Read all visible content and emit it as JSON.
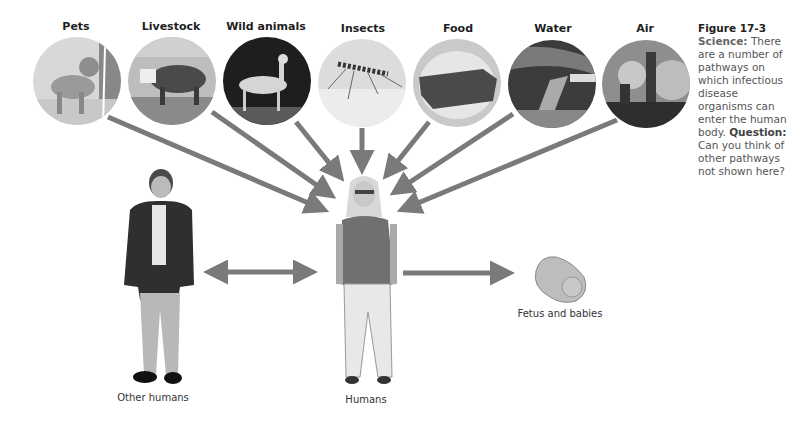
{
  "sources": [
    {
      "label": "Pets",
      "icon": "dog-photo"
    },
    {
      "label": "Livestock",
      "icon": "cow-photo"
    },
    {
      "label": "Wild animals",
      "icon": "deer-photo"
    },
    {
      "label": "Insects",
      "icon": "mosquito-photo"
    },
    {
      "label": "Food",
      "icon": "meat-photo"
    },
    {
      "label": "Water",
      "icon": "sewage-pipe-photo"
    },
    {
      "label": "Air",
      "icon": "smokestack-photo"
    }
  ],
  "people": {
    "other": "Other humans",
    "center": "Humans",
    "fetus": "Fetus and babies"
  },
  "figure": {
    "number": "Figure 17-3",
    "tag": "Science:",
    "text": "There are a number of pathways on which infectious disease organisms can enter the human body.",
    "question_label": "Question:",
    "question": "Can you think of other pathways not shown here?"
  },
  "colors": {
    "arrow": "#7a7a7a",
    "background": "#ffffff"
  }
}
